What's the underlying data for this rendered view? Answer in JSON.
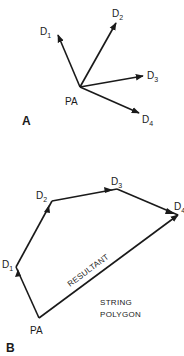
{
  "panel_a": {
    "panel_label": "A",
    "origin_label": "PA",
    "vectors": [
      {
        "name": "D",
        "sub": "1"
      },
      {
        "name": "D",
        "sub": "2"
      },
      {
        "name": "D",
        "sub": "3"
      },
      {
        "name": "D",
        "sub": "4"
      }
    ]
  },
  "panel_b": {
    "panel_label": "B",
    "origin_label": "PA",
    "vertices": [
      {
        "name": "D",
        "sub": "1"
      },
      {
        "name": "D",
        "sub": "2"
      },
      {
        "name": "D",
        "sub": "3"
      },
      {
        "name": "D",
        "sub": "4"
      }
    ],
    "resultant_label": "RESULTANT",
    "caption_line1": "STRING",
    "caption_line2": "POLYGON"
  }
}
